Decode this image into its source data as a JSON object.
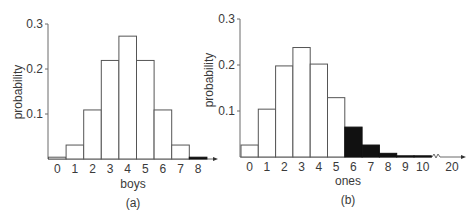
{
  "chart_data": [
    {
      "id": "a",
      "type": "bar",
      "title": "",
      "caption": "(a)",
      "xlabel": "boys",
      "ylabel": "probability",
      "categories": [
        "0",
        "1",
        "2",
        "3",
        "4",
        "5",
        "6",
        "7",
        "8"
      ],
      "values": [
        0.004,
        0.031,
        0.109,
        0.219,
        0.273,
        0.219,
        0.109,
        0.031,
        0.004
      ],
      "shaded": [
        false,
        false,
        false,
        false,
        false,
        false,
        false,
        false,
        true
      ],
      "yticks": [
        "0.1",
        "0.2",
        "0.3"
      ],
      "ylim": [
        0,
        0.3
      ],
      "grid": false,
      "legend": null
    },
    {
      "id": "b",
      "type": "bar",
      "title": "",
      "caption": "(b)",
      "xlabel": "ones",
      "ylabel": "probability",
      "categories": [
        "0",
        "1",
        "2",
        "3",
        "4",
        "5",
        "6",
        "7",
        "8",
        "9",
        "10",
        "20"
      ],
      "values": [
        0.026,
        0.104,
        0.198,
        0.238,
        0.202,
        0.129,
        0.065,
        0.026,
        0.008,
        0.002,
        0.0003,
        0.0
      ],
      "shaded": [
        false,
        false,
        false,
        false,
        false,
        false,
        true,
        true,
        true,
        true,
        true,
        true
      ],
      "yticks": [
        "0.1",
        "0.2",
        "0.3"
      ],
      "ylim": [
        0,
        0.3
      ],
      "axis_break_between": [
        "10",
        "20"
      ],
      "grid": false,
      "legend": null
    }
  ]
}
